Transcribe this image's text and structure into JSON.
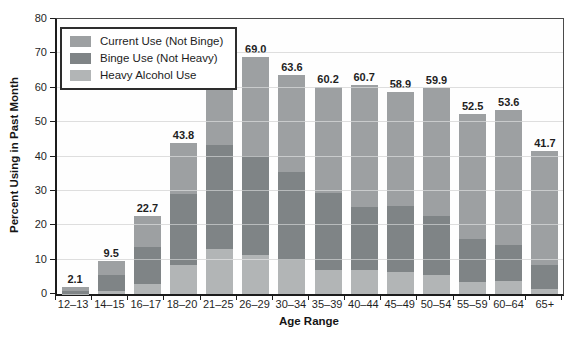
{
  "chart_data": {
    "type": "bar",
    "stacked": true,
    "title": "",
    "xlabel": "Age Range",
    "ylabel": "Percent Using in Past Month",
    "ylim": [
      0,
      80
    ],
    "yticks": [
      0,
      10,
      20,
      30,
      40,
      50,
      60,
      70,
      80
    ],
    "grid": true,
    "legend_position": "top-left-inside",
    "categories": [
      "12–13",
      "14–15",
      "16–17",
      "18–20",
      "21–25",
      "26–29",
      "30–34",
      "35–39",
      "40–44",
      "45–49",
      "50–54",
      "55–59",
      "60–64",
      "65+"
    ],
    "total_labels": [
      "2.1",
      "9.5",
      "22.7",
      "43.8",
      "69.3",
      "69.0",
      "63.6",
      "60.2",
      "60.7",
      "58.9",
      "59.9",
      "52.5",
      "53.6",
      "41.7"
    ],
    "series": [
      {
        "name": "Heavy Alcohol Use",
        "color": "#b2b5b6",
        "values": [
          0.1,
          0.9,
          2.8,
          8.5,
          13.1,
          11.3,
          9.8,
          7.1,
          7.0,
          6.3,
          5.4,
          3.5,
          3.9,
          1.5
        ]
      },
      {
        "name": "Binge Use (Not Heavy)",
        "color": "#7f8486",
        "values": [
          0.8,
          4.6,
          10.8,
          20.7,
          30.2,
          28.9,
          25.6,
          22.2,
          18.3,
          19.2,
          17.3,
          12.6,
          10.4,
          7.0
        ]
      },
      {
        "name": "Current Use (Not Binge)",
        "color": "#9da0a2",
        "values": [
          1.2,
          4.0,
          9.1,
          14.6,
          26.0,
          28.8,
          28.2,
          30.9,
          35.4,
          33.4,
          37.2,
          36.4,
          39.3,
          33.2
        ]
      }
    ],
    "legend": [
      {
        "label": "Current Use (Not Binge)",
        "color": "#9da0a2"
      },
      {
        "label": "Binge Use (Not Heavy)",
        "color": "#7f8486"
      },
      {
        "label": "Heavy Alcohol Use",
        "color": "#b2b5b6"
      }
    ]
  }
}
